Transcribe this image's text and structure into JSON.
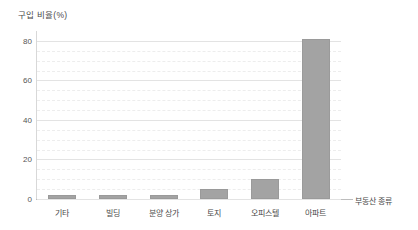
{
  "chart_data": {
    "type": "bar",
    "title": "",
    "subtitle": "",
    "categories": [
      "기타",
      "빌딩",
      "분양 상가",
      "토지",
      "오피스텔",
      "아파트"
    ],
    "values": [
      2,
      2,
      2,
      5,
      10,
      81
    ],
    "xlabel": "부동산 종류",
    "ylabel": "구입 비율(%)",
    "ylim": [
      0,
      85
    ],
    "yticks": [
      0,
      20,
      40,
      60,
      80
    ],
    "ytick_labels": [
      "0",
      "20",
      "40",
      "60",
      "80"
    ],
    "minor_gridlines": [
      5,
      10,
      15,
      25,
      30,
      35,
      45,
      50,
      55,
      65,
      70,
      75
    ],
    "grid": true,
    "legend": null,
    "bar_color": "#a3a3a3",
    "bar_border_color": "#9a9a9a",
    "grid_color": "#e3e3e3",
    "minor_grid_color": "#ededed",
    "axis_color": "#bdbdbd",
    "text_color": "#4a4a4a"
  }
}
